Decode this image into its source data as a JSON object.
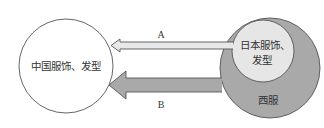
{
  "diagram": {
    "left_circle": {
      "label": "中国服饰、发型",
      "fill": "#ffffff",
      "stroke": "#555555"
    },
    "outer_circle": {
      "label": "西服",
      "fill": "#a9a9a9",
      "stroke": "#555555"
    },
    "inner_circle": {
      "label_line1": "日本服饰、",
      "label_line2": "发型",
      "fill": "#e6e6e6",
      "stroke": "#555555"
    },
    "arrow_a": {
      "label": "A",
      "fill": "#e8e8e8",
      "stroke": "#555555"
    },
    "arrow_b": {
      "label": "B",
      "fill": "#a9a9a9",
      "stroke": "#555555"
    }
  }
}
